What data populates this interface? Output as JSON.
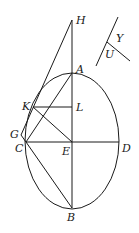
{
  "diagram": {
    "type": "geometry",
    "ellipse": {
      "cx": 72,
      "cy": 141,
      "rx": 47,
      "ry": 68
    },
    "points": {
      "H": {
        "x": 72,
        "y": 20,
        "label": "H",
        "lx": 76,
        "ly": 24
      },
      "A": {
        "x": 72,
        "y": 73,
        "label": "A",
        "lx": 76,
        "ly": 73
      },
      "K": {
        "x": 33,
        "y": 107,
        "label": "K",
        "lx": 22,
        "ly": 110
      },
      "L": {
        "x": 72,
        "y": 107,
        "label": "L",
        "lx": 76,
        "ly": 111
      },
      "G": {
        "x": 21,
        "y": 135,
        "label": "G",
        "lx": 10,
        "ly": 138
      },
      "C": {
        "x": 26,
        "y": 142,
        "label": "C",
        "lx": 15,
        "ly": 152
      },
      "E": {
        "x": 72,
        "y": 142,
        "label": "E",
        "lx": 62,
        "ly": 155
      },
      "D": {
        "x": 119,
        "y": 142,
        "label": "D",
        "lx": 122,
        "ly": 152
      },
      "B": {
        "x": 72,
        "y": 208,
        "label": "B",
        "lx": 67,
        "ly": 221
      }
    },
    "segments": [
      [
        "H",
        "B"
      ],
      [
        "H",
        "G"
      ],
      [
        "K",
        "L"
      ],
      [
        "C",
        "D"
      ],
      [
        "A",
        "C"
      ],
      [
        "K",
        "E"
      ],
      [
        "C",
        "B"
      ],
      [
        "G",
        "C"
      ]
    ],
    "inset": {
      "line1": {
        "x1": 118,
        "y1": 17,
        "x2": 96,
        "y2": 66
      },
      "line2": {
        "x1": 107,
        "y1": 42,
        "x2": 130,
        "y2": 61
      },
      "labels": [
        {
          "text": "Y",
          "x": 116,
          "y": 42
        },
        {
          "text": "U",
          "x": 105,
          "y": 58
        }
      ]
    }
  }
}
